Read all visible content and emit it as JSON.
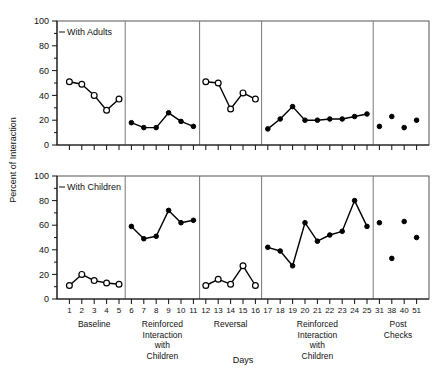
{
  "chart_data": {
    "type": "line",
    "title": "",
    "xlabel": "Days",
    "ylabel": "Percent of Interaction",
    "ylim": [
      0,
      100
    ],
    "yticks": [
      0,
      20,
      40,
      60,
      80,
      100
    ],
    "grid": false,
    "legend": "none",
    "panels": [
      {
        "name": "With Adults",
        "label": "With Adults",
        "segments": [
          {
            "phase": "Baseline",
            "marker": "open",
            "x": [
              1,
              2,
              3,
              4,
              5
            ],
            "y": [
              51,
              49,
              40,
              28,
              37
            ]
          },
          {
            "phase": "Reinforced Interaction with Children",
            "marker": "filled",
            "x": [
              6,
              7,
              8,
              9,
              10,
              11
            ],
            "y": [
              18,
              14,
              14,
              26,
              19,
              15
            ]
          },
          {
            "phase": "Reversal",
            "marker": "open",
            "x": [
              12,
              13,
              14,
              15,
              16
            ],
            "y": [
              51,
              50,
              29,
              42,
              37
            ]
          },
          {
            "phase": "Reinforced Interaction with Children",
            "marker": "filled",
            "x": [
              17,
              18,
              19,
              20,
              21,
              22,
              23,
              24,
              25
            ],
            "y": [
              13,
              21,
              31,
              20,
              20,
              21,
              21,
              23,
              25
            ]
          },
          {
            "phase": "Post Checks",
            "marker": "filled-scatter",
            "x": [
              31,
              38,
              40,
              51
            ],
            "y": [
              15,
              23,
              14,
              20
            ]
          }
        ]
      },
      {
        "name": "With Children",
        "label": "With Children",
        "segments": [
          {
            "phase": "Baseline",
            "marker": "open",
            "x": [
              1,
              2,
              3,
              4,
              5
            ],
            "y": [
              11,
              20,
              15,
              13,
              12
            ]
          },
          {
            "phase": "Reinforced Interaction with Children",
            "marker": "filled",
            "x": [
              6,
              7,
              8,
              9,
              10,
              11
            ],
            "y": [
              59,
              49,
              51,
              72,
              62,
              64
            ]
          },
          {
            "phase": "Reversal",
            "marker": "open",
            "x": [
              12,
              13,
              14,
              15,
              16
            ],
            "y": [
              11,
              16,
              12,
              27,
              11
            ]
          },
          {
            "phase": "Reinforced Interaction with Children",
            "marker": "filled",
            "x": [
              17,
              18,
              19,
              20,
              21,
              22,
              23,
              24,
              25
            ],
            "y": [
              42,
              39,
              27,
              62,
              47,
              52,
              55,
              80,
              59
            ]
          },
          {
            "phase": "Post Checks",
            "marker": "filled-scatter",
            "x": [
              31,
              38,
              40,
              51
            ],
            "y": [
              62,
              33,
              63,
              50
            ]
          }
        ]
      }
    ],
    "xticks": [
      1,
      2,
      3,
      4,
      5,
      6,
      7,
      8,
      9,
      10,
      11,
      12,
      13,
      14,
      15,
      16,
      17,
      18,
      19,
      20,
      21,
      22,
      23,
      24,
      25,
      31,
      38,
      40,
      51
    ],
    "xticklabels": [
      "1",
      "2",
      "3",
      "4",
      "5",
      "6",
      "7",
      "8",
      "9",
      "10",
      "11",
      "12",
      "13",
      "14",
      "15",
      "16",
      "17",
      "18",
      "19",
      "20",
      "21",
      "22",
      "23",
      "24",
      "25",
      "31",
      "38",
      "40",
      "51"
    ],
    "phase_labels": [
      {
        "lines": [
          "Baseline"
        ]
      },
      {
        "lines": [
          "Reinforced",
          "Interaction",
          "with",
          "Children"
        ]
      },
      {
        "lines": [
          "Reversal"
        ]
      },
      {
        "lines": [
          "Reinforced",
          "Interaction",
          "with",
          "Children"
        ]
      },
      {
        "lines": [
          "Post",
          "Checks"
        ]
      }
    ],
    "colors": {
      "line": "#000000",
      "open_marker_fill": "#ffffff",
      "frame": "#555555"
    }
  }
}
